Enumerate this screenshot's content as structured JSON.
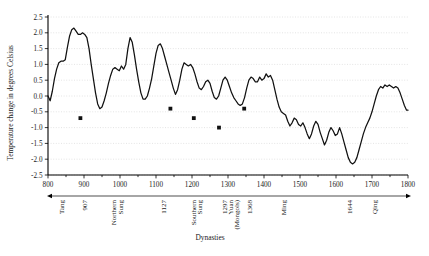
{
  "chart_data": {
    "type": "line",
    "title": "",
    "xlabel": "Dynasties",
    "ylabel": "Temperature change in degrees Celsius",
    "xlim": [
      800,
      1800
    ],
    "ylim": [
      -2.5,
      2.5
    ],
    "grid": true,
    "legend": "none",
    "y_ticks": [
      2.5,
      2.0,
      1.5,
      1.0,
      0.5,
      0.0,
      -0.5,
      -1.0,
      -1.5,
      -2.0,
      -2.5
    ],
    "y_tick_labels": [
      "2.5",
      "2.0",
      "1.5",
      "1.0",
      "0.5",
      "0.0",
      "-0.5",
      "-1.0",
      "-1.5",
      "-2.0",
      "-2.5"
    ],
    "x_ticks": [
      800,
      900,
      1000,
      1100,
      1200,
      1300,
      1400,
      1500,
      1600,
      1700,
      1800
    ],
    "x_tick_labels": [
      "800",
      "900",
      "1000",
      "1100",
      "1200",
      "1300",
      "1400",
      "1500",
      "1600",
      "1700",
      "1800"
    ],
    "x_minor_ticks": [
      850,
      950,
      1050,
      1150,
      1250,
      1350,
      1450,
      1550,
      1650,
      1750
    ],
    "series": [
      {
        "name": "Temperature anomaly",
        "x": [
          800,
          806,
          812,
          818,
          824,
          830,
          836,
          842,
          848,
          854,
          860,
          866,
          872,
          878,
          884,
          890,
          896,
          902,
          908,
          914,
          920,
          926,
          932,
          938,
          944,
          950,
          956,
          962,
          968,
          974,
          980,
          986,
          992,
          998,
          1004,
          1010,
          1016,
          1022,
          1028,
          1034,
          1040,
          1046,
          1052,
          1058,
          1064,
          1070,
          1076,
          1082,
          1088,
          1094,
          1100,
          1106,
          1112,
          1118,
          1124,
          1130,
          1136,
          1142,
          1148,
          1154,
          1160,
          1166,
          1172,
          1178,
          1184,
          1190,
          1196,
          1202,
          1208,
          1214,
          1220,
          1226,
          1232,
          1238,
          1244,
          1250,
          1256,
          1262,
          1268,
          1274,
          1280,
          1286,
          1292,
          1298,
          1304,
          1310,
          1316,
          1322,
          1328,
          1334,
          1340,
          1346,
          1352,
          1358,
          1364,
          1370,
          1376,
          1382,
          1388,
          1394,
          1400,
          1406,
          1412,
          1418,
          1424,
          1430,
          1436,
          1442,
          1448,
          1454,
          1460,
          1466,
          1472,
          1478,
          1484,
          1490,
          1496,
          1502,
          1508,
          1514,
          1520,
          1526,
          1532,
          1538,
          1544,
          1550,
          1556,
          1562,
          1568,
          1574,
          1580,
          1586,
          1592,
          1598,
          1604,
          1610,
          1616,
          1622,
          1628,
          1634,
          1640,
          1646,
          1652,
          1658,
          1664,
          1670,
          1676,
          1682,
          1688,
          1694,
          1700,
          1706,
          1712,
          1718,
          1724,
          1730,
          1736,
          1742,
          1748,
          1754,
          1760,
          1766,
          1772,
          1778,
          1784,
          1790,
          1796,
          1800
        ],
        "y": [
          0.0,
          -0.15,
          0.15,
          0.55,
          0.85,
          1.05,
          1.1,
          1.1,
          1.15,
          1.55,
          1.9,
          2.1,
          2.15,
          2.05,
          1.95,
          1.95,
          2.0,
          1.95,
          1.85,
          1.5,
          1.0,
          0.55,
          0.1,
          -0.25,
          -0.4,
          -0.35,
          -0.15,
          0.1,
          0.4,
          0.65,
          0.85,
          0.9,
          0.85,
          0.8,
          0.95,
          0.85,
          1.0,
          1.5,
          1.85,
          1.7,
          1.3,
          0.85,
          0.45,
          0.1,
          -0.1,
          -0.1,
          0.0,
          0.25,
          0.55,
          0.95,
          1.35,
          1.6,
          1.65,
          1.5,
          1.25,
          1.0,
          0.75,
          0.5,
          0.25,
          0.05,
          0.2,
          0.5,
          0.85,
          1.05,
          1.0,
          0.95,
          1.0,
          0.9,
          0.7,
          0.45,
          0.25,
          0.2,
          0.3,
          0.45,
          0.5,
          0.4,
          0.15,
          -0.05,
          -0.1,
          0.0,
          0.25,
          0.5,
          0.6,
          0.5,
          0.3,
          0.1,
          -0.05,
          -0.15,
          -0.25,
          -0.3,
          -0.25,
          -0.05,
          0.25,
          0.5,
          0.6,
          0.55,
          0.45,
          0.45,
          0.6,
          0.5,
          0.55,
          0.7,
          0.6,
          0.65,
          0.5,
          0.2,
          -0.1,
          -0.35,
          -0.5,
          -0.55,
          -0.6,
          -0.8,
          -0.95,
          -0.85,
          -0.7,
          -0.75,
          -0.9,
          -0.95,
          -0.85,
          -1.0,
          -1.2,
          -1.35,
          -1.2,
          -0.95,
          -0.8,
          -0.9,
          -1.15,
          -1.35,
          -1.55,
          -1.4,
          -1.15,
          -1.0,
          -1.1,
          -1.25,
          -1.2,
          -1.0,
          -1.2,
          -1.45,
          -1.7,
          -1.95,
          -2.1,
          -2.15,
          -2.1,
          -1.95,
          -1.7,
          -1.45,
          -1.2,
          -1.0,
          -0.85,
          -0.7,
          -0.5,
          -0.25,
          0.0,
          0.2,
          0.3,
          0.25,
          0.35,
          0.3,
          0.35,
          0.3,
          0.25,
          0.3,
          0.25,
          0.1,
          -0.1,
          -0.3,
          -0.45,
          -0.45
        ]
      }
    ],
    "markers": [
      {
        "x": 890,
        "y": -0.7
      },
      {
        "x": 1140,
        "y": -0.4
      },
      {
        "x": 1205,
        "y": -0.7
      },
      {
        "x": 1275,
        "y": -1.0
      },
      {
        "x": 1345,
        "y": -0.4
      }
    ],
    "dynasties": [
      {
        "label": "Tang",
        "x": 845
      },
      {
        "label": "907",
        "x": 907
      },
      {
        "label": "Northern\nSung",
        "x": 990
      },
      {
        "label": "1127",
        "x": 1127
      },
      {
        "label": "Southern\nSung",
        "x": 1210
      },
      {
        "label": "1297\nYuan\n(Mongols)",
        "x": 1297
      },
      {
        "label": "1368",
        "x": 1368
      },
      {
        "label": "Ming",
        "x": 1460
      },
      {
        "label": "1644",
        "x": 1644
      },
      {
        "label": "Qing",
        "x": 1715
      }
    ]
  },
  "labels": {
    "y_axis_title": "Temperature change in degrees Celsius",
    "x_axis_title": "Dynasties",
    "dyn_tang": "Tang",
    "dyn_907": "907",
    "dyn_northern_1": "Northern",
    "dyn_northern_2": "Sung",
    "dyn_1127": "1127",
    "dyn_southern_1": "Southern",
    "dyn_southern_2": "Sung",
    "dyn_1297": "1297",
    "dyn_yuan": "Yuan",
    "dyn_mongols": "(Mongols)",
    "dyn_1368": "1368",
    "dyn_ming": "Ming",
    "dyn_1644": "1644",
    "dyn_qing": "Qing"
  },
  "colors": {
    "line": "#111111",
    "grid": "#c9c9c9",
    "axis": "#000000",
    "background": "#ffffff",
    "marker": "#111111"
  }
}
